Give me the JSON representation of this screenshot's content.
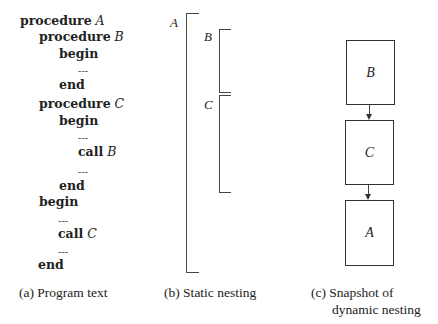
{
  "program_text": {
    "lines": [
      {
        "kw": "procedure",
        "id": "A",
        "indent": 0
      },
      {
        "kw": "procedure",
        "id": "B",
        "indent": 1
      },
      {
        "kw": "begin",
        "id": "",
        "indent": 2
      },
      {
        "kw": "---",
        "id": "",
        "indent": 3
      },
      {
        "kw": "end",
        "id": "",
        "indent": 2
      },
      {
        "kw": "procedure",
        "id": "C",
        "indent": 1
      },
      {
        "kw": "begin",
        "id": "",
        "indent": 2
      },
      {
        "kw": "---",
        "id": "",
        "indent": 3
      },
      {
        "kw": "call",
        "id": "B",
        "indent": 3
      },
      {
        "kw": "---",
        "id": "",
        "indent": 3
      },
      {
        "kw": "end",
        "id": "",
        "indent": 2
      },
      {
        "kw": "begin",
        "id": "",
        "indent": 1
      },
      {
        "kw": "---",
        "id": "",
        "indent": 2
      },
      {
        "kw": "call",
        "id": "C",
        "indent": 2
      },
      {
        "kw": "---",
        "id": "",
        "indent": 2
      },
      {
        "kw": "end",
        "id": "",
        "indent": 1
      }
    ],
    "caption": "(a) Program text"
  },
  "static_nesting": {
    "labels": {
      "outer": "A",
      "inner1": "B",
      "inner2": "C"
    },
    "caption": "(b) Static nesting"
  },
  "dynamic_nesting": {
    "frames": [
      "B",
      "C",
      "A"
    ],
    "caption_line1": "(c) Snapshot of",
    "caption_line2": "dynamic nesting"
  }
}
